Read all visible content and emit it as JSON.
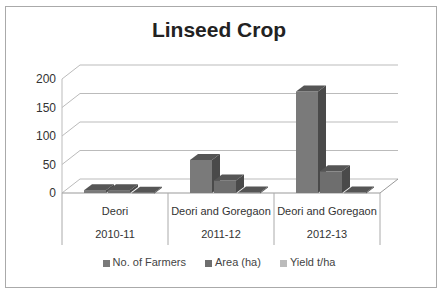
{
  "chart_data": {
    "type": "bar",
    "title": "Linseed Crop",
    "categories": [
      [
        "Deori",
        "2010-11"
      ],
      [
        "Deori and Goregaon",
        "2011-12"
      ],
      [
        "Deori and Goregaon",
        "2012-13"
      ]
    ],
    "series": [
      {
        "name": "No. of Farmers",
        "values": [
          5,
          58,
          178
        ],
        "color": "#7a7a7a"
      },
      {
        "name": "Area  (ha)",
        "values": [
          5,
          22,
          38
        ],
        "color": "#6e6e6e"
      },
      {
        "name": "Yield t/ha",
        "values": [
          0.5,
          1,
          1
        ],
        "color": "#a8a8a8"
      }
    ],
    "ylim": [
      0,
      200
    ],
    "yticks": [
      0,
      50,
      100,
      150,
      200
    ],
    "grid": true,
    "legend_position": "bottom",
    "xlabel": "",
    "ylabel": ""
  },
  "legend": [
    "No. of Farmers",
    "Area  (ha)",
    "Yield t/ha"
  ]
}
